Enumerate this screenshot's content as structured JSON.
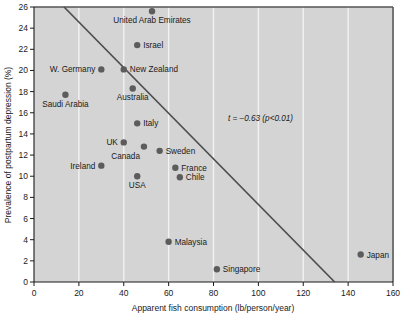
{
  "chart_data": {
    "type": "scatter",
    "title": "",
    "xlabel": "Apparent fish consumption (lb/person/year)",
    "ylabel": "Prevalence of postpartum depression (%)",
    "xlim": [
      0,
      160
    ],
    "ylim": [
      0,
      26
    ],
    "xticks": [
      0,
      20,
      40,
      60,
      80,
      100,
      120,
      140,
      160
    ],
    "yticks": [
      0,
      2,
      4,
      6,
      8,
      10,
      12,
      14,
      16,
      18,
      20,
      22,
      24,
      26
    ],
    "grid": "vertical-only",
    "legend": "none",
    "background_color": "#d4d4d4",
    "point_color": "#5c5c5c",
    "line_color": "#4d4d4d",
    "annotation": "t = –0.63 (p<0.01)",
    "trendline": {
      "x": [
        13.4,
        134.0
      ],
      "y": [
        26.0,
        0.0
      ]
    },
    "points": [
      {
        "label": "United Arab Emirates",
        "x": 52.6,
        "y": 25.6,
        "label_pos": "below"
      },
      {
        "label": "Israel",
        "x": 46.0,
        "y": 22.4,
        "label_pos": "right"
      },
      {
        "label": "W. Germany",
        "x": 30.0,
        "y": 20.1,
        "label_pos": "left"
      },
      {
        "label": "New Zealand",
        "x": 40.0,
        "y": 20.1,
        "label_pos": "right"
      },
      {
        "label": "Australia",
        "x": 44.0,
        "y": 18.3,
        "label_pos": "below"
      },
      {
        "label": "Saudi Arabia",
        "x": 14.0,
        "y": 17.7,
        "label_pos": "below"
      },
      {
        "label": "Italy",
        "x": 46.0,
        "y": 15.0,
        "label_pos": "right"
      },
      {
        "label": "UK",
        "x": 40.0,
        "y": 13.2,
        "label_pos": "left"
      },
      {
        "label": "Canada",
        "x": 49.0,
        "y": 12.8,
        "label_pos": "below-left"
      },
      {
        "label": "Sweden",
        "x": 56.0,
        "y": 12.4,
        "label_pos": "right"
      },
      {
        "label": "Ireland",
        "x": 30.0,
        "y": 11.0,
        "label_pos": "left"
      },
      {
        "label": "France",
        "x": 63.0,
        "y": 10.8,
        "label_pos": "right"
      },
      {
        "label": "USA",
        "x": 46.0,
        "y": 10.0,
        "label_pos": "below"
      },
      {
        "label": "Chile",
        "x": 65.0,
        "y": 9.9,
        "label_pos": "right"
      },
      {
        "label": "Malaysia",
        "x": 60.0,
        "y": 3.8,
        "label_pos": "right"
      },
      {
        "label": "Japan",
        "x": 145.6,
        "y": 2.6,
        "label_pos": "right"
      },
      {
        "label": "Singapore",
        "x": 81.5,
        "y": 1.2,
        "label_pos": "right"
      }
    ]
  },
  "axes": {
    "x_tick_labels": [
      "0",
      "20",
      "40",
      "60",
      "80",
      "100",
      "120",
      "140",
      "160"
    ],
    "y_tick_labels": [
      "0",
      "2",
      "4",
      "6",
      "8",
      "10",
      "12",
      "14",
      "16",
      "18",
      "20",
      "22",
      "24",
      "26"
    ],
    "x_axis_title": "Apparent fish consumption (lb/person/year)",
    "y_axis_title": "Prevalence of postpartum depression (%)"
  },
  "annotation": {
    "text": "t = –0.63 (p<0.01)"
  }
}
